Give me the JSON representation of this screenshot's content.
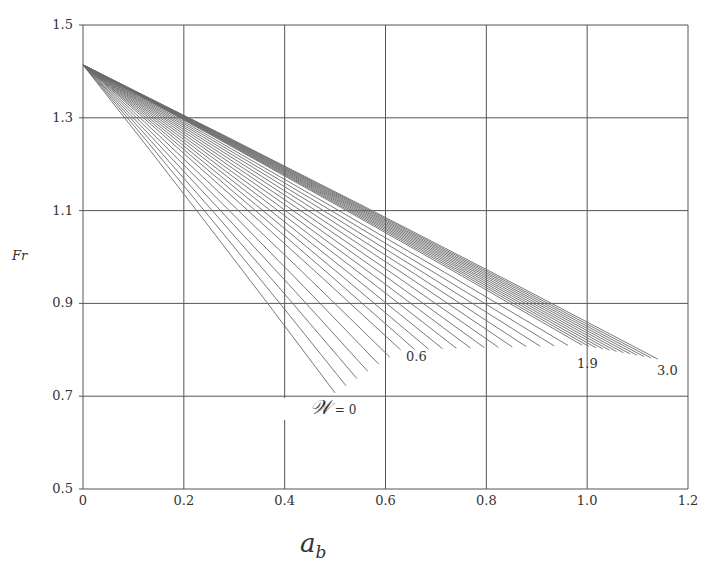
{
  "chart_data": {
    "type": "line",
    "title": "",
    "xlabel": "a_b",
    "ylabel": "Fr",
    "xlim": [
      0,
      1.2
    ],
    "ylim": [
      0.5,
      1.5
    ],
    "xticks": [
      "0",
      "0.2",
      "0.4",
      "0.6",
      "0.8",
      "1.0",
      "1.2"
    ],
    "yticks": [
      "0.5",
      "0.7",
      "0.9",
      "1.1",
      "1.3",
      "1.5"
    ],
    "grid": true,
    "legend": "none",
    "parameter_name": "W",
    "parameter_range": [
      0,
      3.0
    ],
    "parameter_step": 0.1,
    "series_count": 31,
    "common_start": {
      "x": 0,
      "y": 1.414
    },
    "endpoints": [
      {
        "W": 0.0,
        "x": 0.5,
        "y": 0.707
      },
      {
        "W": 0.6,
        "x": 0.63,
        "y": 0.8
      },
      {
        "W": 1.9,
        "x": 0.99,
        "y": 0.81
      },
      {
        "W": 3.0,
        "x": 1.14,
        "y": 0.78
      }
    ],
    "annotations": [
      {
        "text": "W = 0",
        "x": 0.46,
        "y": 0.69
      },
      {
        "text": "0.6",
        "x": 0.67,
        "y": 0.82
      },
      {
        "text": "1.9",
        "x": 1.0,
        "y": 0.8
      },
      {
        "text": "3.0",
        "x": 1.15,
        "y": 0.76
      }
    ]
  },
  "labels": {
    "y_axis": "Fr",
    "x_axis_main": "a",
    "x_axis_sub": "b",
    "w_symbol": "𝒲",
    "w_eq": " = 0",
    "ann_06": "0.6",
    "ann_19": "1.9",
    "ann_30": "3.0"
  },
  "colors": {
    "grid": "#555555",
    "curve": "#6a6a6a",
    "text": "#333333"
  }
}
